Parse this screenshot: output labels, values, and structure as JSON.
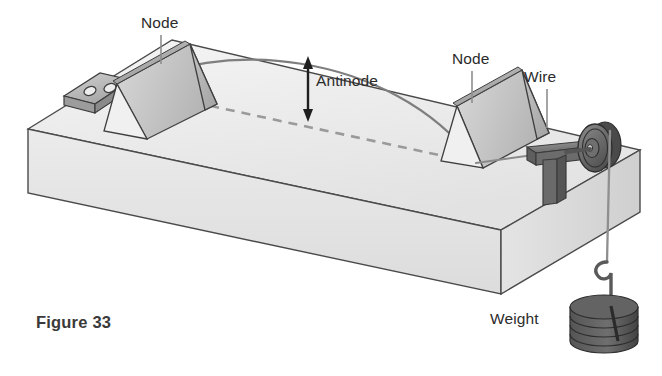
{
  "figure": {
    "caption": "Figure 33"
  },
  "labels": {
    "node_left": "Node",
    "node_right": "Node",
    "wire": "Wire",
    "antinode": "Antinode",
    "weight": "Weight"
  },
  "colors": {
    "outline": "#3f3f3f",
    "base_top": "#ededed",
    "base_front": "#e6e6e6",
    "base_side": "#d5d5d5",
    "bridge_light": "#cfcfcf",
    "bridge_mid": "#bdbdbd",
    "bridge_dark": "#a9a9a9",
    "pulley_dark": "#595959",
    "pulley_mid": "#7d7d7d",
    "weight_dark": "#4a4a4a",
    "weight_mid": "#6e6e6e",
    "wire_line": "#8a8a8a",
    "dashed_wire": "#9a9a9a",
    "text": "#2b2b2b",
    "caption_text": "#3a3a3a",
    "background": "#ffffff"
  },
  "parts": [
    {
      "name": "sounding-board-base",
      "description": "Large rectangular wooden box drawn in oblique projection"
    },
    {
      "name": "wire-anchor-block",
      "description": "Small block with two holes on the left of the board where the wire is fixed"
    },
    {
      "name": "bridge-left",
      "description": "Triangular prism bridge forming the left node"
    },
    {
      "name": "bridge-right",
      "description": "Triangular prism bridge forming the right node"
    },
    {
      "name": "pulley",
      "description": "Grooved pulley on a bracket at the right end of the board"
    },
    {
      "name": "wire-vibrating-arc",
      "description": "Solid curved line showing the wire displaced in its fundamental mode"
    },
    {
      "name": "wire-rest-dashed",
      "description": "Dashed straight line showing the wire at rest between the bridges"
    },
    {
      "name": "antinode-arrow",
      "description": "Double-headed vertical arrow measuring maximum displacement"
    },
    {
      "name": "hanging-wire",
      "description": "Vertical wire segment from the pulley down to the weight hook"
    },
    {
      "name": "weight-stack",
      "description": "Stack of four slotted disc masses hanging from a hook"
    }
  ]
}
